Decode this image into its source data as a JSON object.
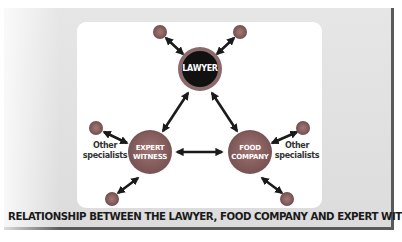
{
  "diagram": {
    "caption": "RELATIONSHIP BETWEEN THE LAWYER, FOOD COMPANY AND EXPERT WITNESS.",
    "nodes": {
      "lawyer": {
        "label": "LAWYER",
        "color": "#111111",
        "ring": "#7a5c5c"
      },
      "expert_witness": {
        "line1": "EXPERT",
        "line2": "WITNESS",
        "color": "#8a6262"
      },
      "food_company": {
        "line1": "FOOD",
        "line2": "COMPANY",
        "color": "#8a6262"
      }
    },
    "side_labels": {
      "left": {
        "line1": "Other",
        "line2": "specialists"
      },
      "right": {
        "line1": "Other",
        "line2": "specialists"
      }
    },
    "satellite_count": 6,
    "colors": {
      "panel_bg": "#e0e0e0",
      "canvas_bg": "#ffffff",
      "satellite": "#8a6262",
      "arrow": "#1a1a1a",
      "border": "#5a5a5a"
    }
  }
}
